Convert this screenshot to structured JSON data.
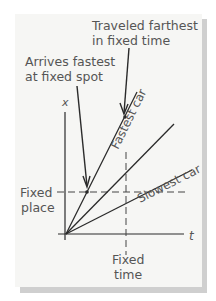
{
  "figure": {
    "annotations": {
      "traveled_farthest_line1": "Traveled farthest",
      "traveled_farthest_line2": "in fixed time",
      "arrives_fastest_line1": "Arrives fastest",
      "arrives_fastest_line2": "at fixed spot"
    },
    "axes": {
      "x_label": "x",
      "t_label": "t"
    },
    "lines": {
      "fastest": "Fastest car",
      "slowest": "Slowest car"
    },
    "guides": {
      "fixed_place_line1": "Fixed",
      "fixed_place_line2": "place",
      "fixed_time_line1": "Fixed",
      "fixed_time_line2": "time"
    },
    "colors": {
      "line": "#2a2a2a",
      "text": "#555555",
      "panel": "#f6f6f4",
      "shadow": "#cfcfcf"
    }
  }
}
